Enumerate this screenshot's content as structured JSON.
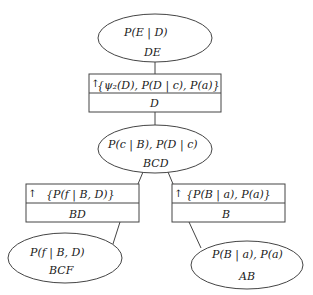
{
  "diagram": {
    "type": "junction-tree",
    "cliques": [
      {
        "id": "DE",
        "potentials": "P(E | D)",
        "label": "DE"
      },
      {
        "id": "BCD",
        "potentials": "P(c | B), P(D | c)",
        "label": "BCD"
      },
      {
        "id": "BCF",
        "potentials": "P(f | B, D)",
        "label": "BCF"
      },
      {
        "id": "AB",
        "potentials": "P(B | a), P(a)",
        "label": "AB"
      }
    ],
    "separators": [
      {
        "id": "D",
        "arrow": "↑",
        "messages": "{ψ₂(D), P(D | c), P(a)}",
        "label": "D"
      },
      {
        "id": "BD",
        "arrow": "↑",
        "messages": "{P(f | B, D)}",
        "label": "BD"
      },
      {
        "id": "B",
        "arrow": "↑",
        "messages": "{P(B | a), P(a)}",
        "label": "B"
      }
    ],
    "edges": [
      [
        "DE",
        "D"
      ],
      [
        "D",
        "BCD"
      ],
      [
        "BCD",
        "BD"
      ],
      [
        "BCD",
        "B"
      ],
      [
        "BD",
        "BCF"
      ],
      [
        "B",
        "AB"
      ]
    ]
  }
}
